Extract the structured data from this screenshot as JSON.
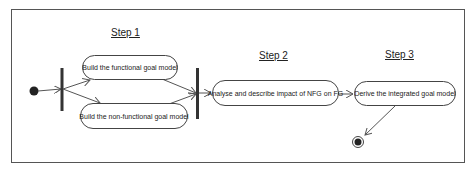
{
  "diagram": {
    "type": "uml-activity",
    "steps": [
      {
        "label": "Step 1"
      },
      {
        "label": "Step 2"
      },
      {
        "label": "Step 3"
      }
    ],
    "activities": [
      {
        "id": "a1",
        "label": "Build the functional goal model"
      },
      {
        "id": "a2",
        "label": "Build the non-functional goal model"
      },
      {
        "id": "a3",
        "label": "Analyse and describe impact of NFG on FG"
      },
      {
        "id": "a4",
        "label": "Derive the integrated goal model"
      }
    ],
    "nodes": {
      "initial": "initial-node",
      "fork": "fork-bar",
      "join": "join-bar",
      "final": "final-node"
    },
    "colors": {
      "stroke": "#444444",
      "bar": "#333333",
      "node_fill": "#222222"
    }
  }
}
